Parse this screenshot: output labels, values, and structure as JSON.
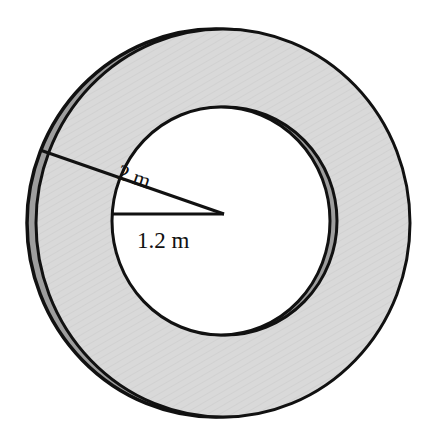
{
  "diagram": {
    "shape": "ring",
    "outer_radius_label": "2 m",
    "inner_radius_label": "1.2 m",
    "outer_radius_value": 2,
    "inner_radius_value": 1.2,
    "unit": "m",
    "colors": {
      "ring_fill": "#d8d8d8",
      "ring_shadow": "#9e9e9e",
      "stroke": "#111111",
      "hole_fill": "#ffffff"
    }
  }
}
